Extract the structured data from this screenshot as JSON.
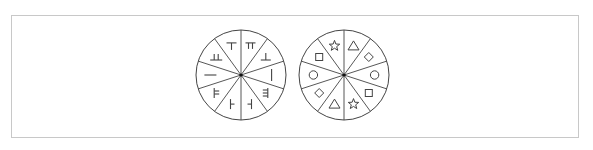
{
  "figure": {
    "stroke_color": "#444444",
    "frame_color": "#c8c8c8",
    "sectors_per_circle": 10,
    "circles": [
      {
        "id": "circle-1",
        "cx": 241,
        "cy": 75,
        "r": 45,
        "symbol_type": "strokes",
        "symbols": [
          "pi",
          "up-tack",
          "vertical-bar",
          "triple-left",
          "left-tee",
          "right-tee",
          "double-right",
          "horizontal-bar",
          "double-up",
          "down-tack"
        ]
      },
      {
        "id": "circle-2",
        "cx": 344,
        "cy": 75,
        "r": 45,
        "symbol_type": "shapes",
        "symbols": [
          "triangle",
          "diamond",
          "circle",
          "square",
          "star",
          "triangle",
          "diamond",
          "circle",
          "square",
          "star"
        ]
      }
    ]
  }
}
